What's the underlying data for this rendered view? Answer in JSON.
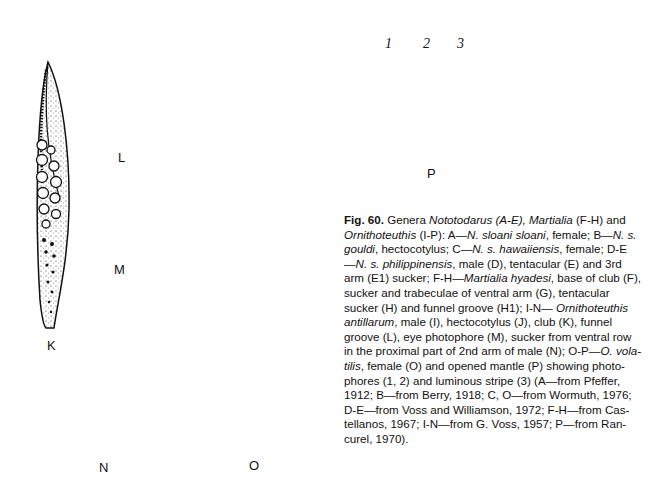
{
  "figure": {
    "number_label": "Fig. 60.",
    "panel_labels": {
      "K": "K",
      "L": "L",
      "M": "M",
      "N": "N",
      "O": "O",
      "P": "P"
    },
    "callouts": [
      "1",
      "2",
      "3"
    ],
    "panels": [
      {
        "id": "K",
        "description": "club (tentacular club, Ornithoteuthis antillarum)"
      },
      {
        "id": "L",
        "description": "funnel groove"
      },
      {
        "id": "M",
        "description": "eye photophore"
      },
      {
        "id": "N",
        "description": "sucker from ventral row in the proximal part of 2nd arm of male"
      },
      {
        "id": "O",
        "description": "O. volatilis, female, whole animal dorsal view"
      },
      {
        "id": "P",
        "description": "opened mantle showing photophores (1, 2) and luminous stripe (3)"
      }
    ]
  },
  "caption": {
    "lines": [
      [
        {
          "t": "Fig. 60.",
          "s": "b"
        },
        {
          "t": " Genera "
        },
        {
          "t": "Nototodarus (A-E), Martialia",
          "s": "i"
        },
        {
          "t": " (F-H) and"
        }
      ],
      [
        {
          "t": "Ornithoteuthis",
          "s": "i"
        },
        {
          "t": " (I-P): A—"
        },
        {
          "t": "N. sloani sloani",
          "s": "i"
        },
        {
          "t": ", female; B—"
        },
        {
          "t": "N. s.",
          "s": "i"
        }
      ],
      [
        {
          "t": "gouldi",
          "s": "i"
        },
        {
          "t": ", hectocotylus; C—"
        },
        {
          "t": "N. s. hawaiiensis",
          "s": "i"
        },
        {
          "t": ", female; D-E"
        }
      ],
      [
        {
          "t": "—"
        },
        {
          "t": "N. s. philippinensis",
          "s": "i"
        },
        {
          "t": ", male (D), tentacular (E) and 3rd"
        }
      ],
      [
        {
          "t": "arm (E1) sucker; F-H—"
        },
        {
          "t": "Martialia hyadesi",
          "s": "i"
        },
        {
          "t": ", base of club (F),"
        }
      ],
      [
        {
          "t": "sucker and trabeculae of ventral arm (G), tentacular"
        }
      ],
      [
        {
          "t": "sucker (H) and funnel groove (H1); I-N— "
        },
        {
          "t": "Ornithoteuthis",
          "s": "i"
        }
      ],
      [
        {
          "t": "antillarum",
          "s": "i"
        },
        {
          "t": ", male (I), hectocotylus (J), club (K), funnel"
        }
      ],
      [
        {
          "t": "groove (L), eye photophore (M), sucker from ventral row"
        }
      ],
      [
        {
          "t": "in the proximal part of 2nd arm of male (N); O-P—"
        },
        {
          "t": "O. vola-",
          "s": "i"
        }
      ],
      [
        {
          "t": "tilis",
          "s": "i"
        },
        {
          "t": ", female (O) and opened mantle (P) showing photo-"
        }
      ],
      [
        {
          "t": "phores (1, 2) and luminous stripe (3) (A—from Pfeffer,"
        }
      ],
      [
        {
          "t": "1912; B—from Berry, 1918; C, O—from Wormuth, 1976;"
        }
      ],
      [
        {
          "t": "D-E—from Voss and Williamson, 1972; F-H—from Cas-"
        }
      ],
      [
        {
          "t": "tellanos, 1967; I-N—from G. Voss, 1957; P—from Ran-"
        }
      ],
      [
        {
          "t": "curel, 1970)."
        }
      ]
    ]
  },
  "colors": {
    "ink": "#111111",
    "paper": "#ffffff"
  }
}
